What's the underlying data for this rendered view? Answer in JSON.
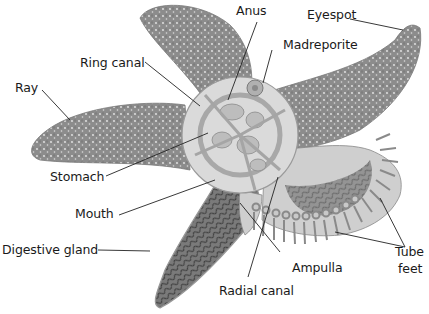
{
  "diagram": {
    "colors": {
      "background": "#ffffff",
      "skin": "#8f8f8f",
      "skin_dark": "#6e6e6e",
      "skin_spots": "#e6e6e6",
      "internal": "#d8d8d8",
      "internal_line": "#8a8a8a",
      "gland": "#5a5a5a",
      "leader_line": "#222222",
      "text": "#1a1a1a"
    },
    "labels": [
      {
        "id": "anus",
        "text": "Anus"
      },
      {
        "id": "eyespot",
        "text": "Eyespot"
      },
      {
        "id": "madreporite",
        "text": "Madreporite"
      },
      {
        "id": "ring_canal",
        "text": "Ring canal"
      },
      {
        "id": "ray",
        "text": "Ray"
      },
      {
        "id": "stomach",
        "text": "Stomach"
      },
      {
        "id": "mouth",
        "text": "Mouth"
      },
      {
        "id": "digestive_gland",
        "text": "Digestive gland"
      },
      {
        "id": "ampulla",
        "text": "Ampulla"
      },
      {
        "id": "tube_feet_1",
        "text": "Tube"
      },
      {
        "id": "tube_feet_2",
        "text": "feet"
      },
      {
        "id": "radial_canal",
        "text": "Radial canal"
      }
    ]
  }
}
